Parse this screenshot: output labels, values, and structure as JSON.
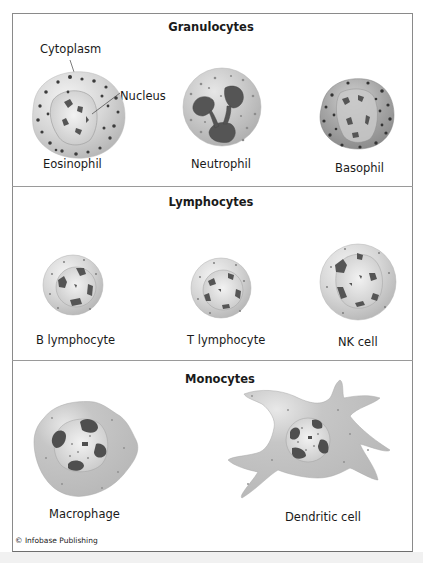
{
  "figure": {
    "sections": [
      {
        "title": "Granulocytes",
        "cells": [
          {
            "name": "Eosinophil"
          },
          {
            "name": "Neutrophil"
          },
          {
            "name": "Basophil"
          }
        ],
        "callouts": {
          "cytoplasm": "Cytoplasm",
          "nucleus": "Nucleus"
        }
      },
      {
        "title": "Lymphocytes",
        "cells": [
          {
            "name": "B lymphocyte"
          },
          {
            "name": "T lymphocyte"
          },
          {
            "name": "NK cell"
          }
        ]
      },
      {
        "title": "Monocytes",
        "cells": [
          {
            "name": "Macrophage"
          },
          {
            "name": "Dendritic cell"
          }
        ]
      }
    ],
    "credit": "© Infobase Publishing",
    "colors": {
      "cytoplasm_light": "#d9d9d9",
      "cytoplasm_mid": "#bdbdbd",
      "cytoplasm_dark": "#9b9b9b",
      "nucleus_chromatin": "#555555",
      "granule": "#3c3c3c",
      "frame": "#8a8a8a"
    }
  }
}
